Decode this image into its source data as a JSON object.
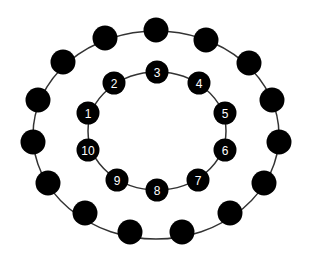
{
  "diagram": {
    "title": "",
    "colors": {
      "node": "#000000",
      "line": "#333333",
      "label": "#ffffff",
      "background": "#ffffff"
    },
    "outer_ring": {
      "ellipse": {
        "cx": 156,
        "cy": 135,
        "rx": 123,
        "ry": 104
      },
      "node_radius": 12.5,
      "nodes": [
        {
          "x": 156,
          "y": 30
        },
        {
          "x": 206,
          "y": 40
        },
        {
          "x": 249,
          "y": 63
        },
        {
          "x": 272,
          "y": 100
        },
        {
          "x": 279,
          "y": 142
        },
        {
          "x": 264,
          "y": 183
        },
        {
          "x": 230,
          "y": 213
        },
        {
          "x": 182,
          "y": 232
        },
        {
          "x": 130,
          "y": 232
        },
        {
          "x": 85,
          "y": 213
        },
        {
          "x": 48,
          "y": 183
        },
        {
          "x": 33,
          "y": 142
        },
        {
          "x": 38,
          "y": 100
        },
        {
          "x": 63,
          "y": 62
        },
        {
          "x": 105,
          "y": 38
        }
      ]
    },
    "inner_ring": {
      "ellipse": {
        "cx": 157,
        "cy": 131,
        "rx": 69,
        "ry": 59
      },
      "node_radius": 11.5,
      "nodes": [
        {
          "label": "1",
          "x": 88,
          "y": 113
        },
        {
          "label": "2",
          "x": 114,
          "y": 83
        },
        {
          "label": "3",
          "x": 157,
          "y": 72
        },
        {
          "label": "4",
          "x": 199,
          "y": 83
        },
        {
          "label": "5",
          "x": 225,
          "y": 113
        },
        {
          "label": "6",
          "x": 225,
          "y": 150
        },
        {
          "label": "7",
          "x": 198,
          "y": 180
        },
        {
          "label": "8",
          "x": 157,
          "y": 190
        },
        {
          "label": "9",
          "x": 117,
          "y": 180
        },
        {
          "label": "10",
          "x": 88,
          "y": 150
        }
      ]
    }
  }
}
